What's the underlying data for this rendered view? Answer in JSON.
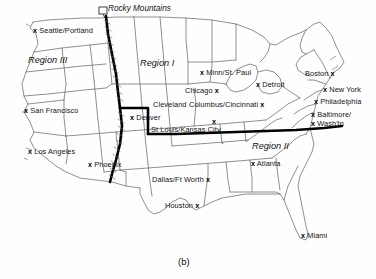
{
  "figure": {
    "caption": "(b)",
    "type": "map-diagram"
  },
  "annotations": [
    {
      "name": "rocky-mountains",
      "text": "Rocky Mountains",
      "x": 106,
      "y": 9
    }
  ],
  "regions": [
    {
      "id": "region-3",
      "label": "Region III",
      "x": 28,
      "y": 60
    },
    {
      "id": "region-1",
      "label": "Region I",
      "x": 140,
      "y": 63
    },
    {
      "id": "region-2",
      "label": "Region II",
      "x": 252,
      "y": 146
    }
  ],
  "cities": [
    {
      "name": "seattle-portland",
      "label": "Seattle/Portland",
      "marker": "x",
      "marker_side": "left",
      "lx": 38,
      "ly": 31,
      "mx": 33,
      "my": 31
    },
    {
      "name": "san-francisco",
      "label": "San Francisco",
      "marker": "x",
      "marker_side": "left",
      "lx": 31,
      "ly": 111,
      "mx": 24,
      "my": 111
    },
    {
      "name": "los-angeles",
      "label": "Los Angeles",
      "marker": "x",
      "marker_side": "left",
      "lx": 35,
      "ly": 152,
      "mx": 28,
      "my": 152
    },
    {
      "name": "phoenix",
      "label": "Phoenix",
      "marker": "x",
      "marker_side": "left",
      "lx": 95,
      "ly": 165,
      "mx": 88,
      "my": 165
    },
    {
      "name": "denver",
      "label": "Denver",
      "marker": "x",
      "marker_side": "left",
      "lx": 137,
      "ly": 118,
      "mx": 130,
      "my": 118
    },
    {
      "name": "minn-st-paul",
      "label": "Minn/St. Paul",
      "marker": "x",
      "marker_side": "left",
      "lx": 206,
      "ly": 73,
      "mx": 200,
      "my": 73
    },
    {
      "name": "chicago",
      "label": "Chicago",
      "marker": "x",
      "marker_side": "right",
      "lx": 185,
      "ly": 91,
      "mx": 212,
      "my": 91
    },
    {
      "name": "detroit",
      "label": "Detroit",
      "marker": "x",
      "marker_side": "left",
      "lx": 262,
      "ly": 85,
      "mx": 256,
      "my": 85
    },
    {
      "name": "cleveland",
      "label": "Cleveland",
      "marker": "none",
      "marker_side": "none",
      "lx": 153,
      "ly": 105,
      "mx": 0,
      "my": 0
    },
    {
      "name": "columbus-cincinnati",
      "label": "Columbus/Cincinnati",
      "marker": "x",
      "marker_side": "right",
      "lx": 189,
      "ly": 105,
      "mx": 248,
      "my": 105
    },
    {
      "name": "st-louis-kansas-city",
      "label": "St Louis/Kansas City",
      "marker": "x",
      "marker_side": "above",
      "lx": 151,
      "ly": 130,
      "mx": 212,
      "my": 122
    },
    {
      "name": "boston",
      "label": "Boston",
      "marker": "x",
      "marker_side": "right",
      "lx": 305,
      "ly": 74,
      "mx": 330,
      "my": 74
    },
    {
      "name": "new-york",
      "label": "New York",
      "marker": "x",
      "marker_side": "left",
      "lx": 329,
      "ly": 90,
      "mx": 323,
      "my": 90
    },
    {
      "name": "philadelphia",
      "label": "Philadelphia",
      "marker": "x",
      "marker_side": "left",
      "lx": 320,
      "ly": 102,
      "mx": 314,
      "my": 102
    },
    {
      "name": "baltimore-washington",
      "label": "Baltimore/",
      "marker": "x",
      "marker_side": "left",
      "lx": 318,
      "ly": 115,
      "mx": 311,
      "my": 115
    },
    {
      "name": "baltimore-washington-2",
      "label": "Wash'tn",
      "marker": "x",
      "marker_side": "left",
      "lx": 318,
      "ly": 124,
      "mx": 311,
      "my": 124
    },
    {
      "name": "atlanta",
      "label": "Atlanta",
      "marker": "x",
      "marker_side": "left",
      "lx": 258,
      "ly": 164,
      "mx": 251,
      "my": 164
    },
    {
      "name": "dallas-ft-worth",
      "label": "Dallas/Ft Worth",
      "marker": "x",
      "marker_side": "right",
      "lx": 152,
      "ly": 180,
      "mx": 206,
      "my": 180
    },
    {
      "name": "houston",
      "label": "Houston",
      "marker": "x",
      "marker_side": "right",
      "lx": 165,
      "ly": 206,
      "mx": 192,
      "my": 206
    },
    {
      "name": "miami",
      "label": "Miami",
      "marker": "x",
      "marker_side": "left",
      "lx": 307,
      "ly": 236,
      "mx": 301,
      "my": 236
    }
  ],
  "colors": {
    "border": "#5a5a5a",
    "boundary": "#000000",
    "text": "#121212",
    "background": "#ffffff"
  }
}
